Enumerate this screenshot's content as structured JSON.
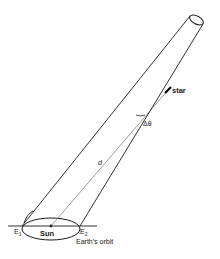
{
  "diagram": {
    "labels": {
      "star": "star",
      "delta_theta": "Δθ",
      "distance": "d",
      "sun": "Sun",
      "e1": "E",
      "e1_sub": "1",
      "e2": "E",
      "e2_sub": "2",
      "orbit": "Earth's orbit"
    },
    "colors": {
      "line": "#1a1a1a",
      "background": "#ffffff"
    }
  }
}
